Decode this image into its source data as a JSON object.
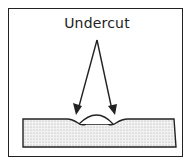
{
  "diagram": {
    "label": "Undercut",
    "colors": {
      "line": "#222222",
      "fill": "#dedede",
      "background": "#ffffff"
    }
  }
}
